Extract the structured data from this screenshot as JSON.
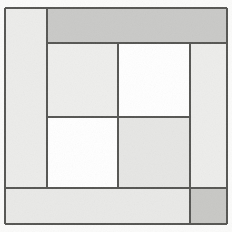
{
  "artwork": {
    "title": "Geometric Block Composition",
    "medium": "abstract rectangular grid",
    "canvas_width": 232,
    "canvas_height": 232,
    "background_color": "#fbfbfa",
    "line_color": "#555552",
    "line_width": 1.5
  },
  "palette": {
    "paper": "#fbfbfa",
    "white": "#ffffff",
    "light_gray": "#ececeb",
    "pale_gray": "#e4e4e2",
    "medium_gray": "#c9c9c7",
    "dark_edge": "#5a5a57"
  },
  "blocks": [
    {
      "name": "top-band",
      "label": "top band",
      "fill": "#c9c9c7",
      "x": 47,
      "y": 8,
      "w": 180,
      "h": 35
    },
    {
      "name": "left-strip",
      "label": "left vertical strip",
      "fill": "#ececea",
      "x": 5,
      "y": 8,
      "w": 42,
      "h": 180
    },
    {
      "name": "inner-upper-left",
      "label": "inner upper left block",
      "fill": "#eeeeec",
      "x": 47,
      "y": 43,
      "w": 71,
      "h": 74
    },
    {
      "name": "upper-right-white",
      "label": "upper right white block",
      "fill": "#ffffff",
      "x": 118,
      "y": 43,
      "w": 72,
      "h": 74
    },
    {
      "name": "right-strip",
      "label": "right vertical strip",
      "fill": "#ededeb",
      "x": 190,
      "y": 43,
      "w": 37,
      "h": 145
    },
    {
      "name": "lower-left-white",
      "label": "lower left white block",
      "fill": "#ffffff",
      "x": 47,
      "y": 117,
      "w": 71,
      "h": 71
    },
    {
      "name": "center-lower-gray",
      "label": "center lower gray block",
      "fill": "#e6e6e4",
      "x": 118,
      "y": 117,
      "w": 72,
      "h": 71
    },
    {
      "name": "bottom-band",
      "label": "bottom band",
      "fill": "#e9e9e7",
      "x": 5,
      "y": 188,
      "w": 185,
      "h": 36
    },
    {
      "name": "bottom-right-corner",
      "label": "bottom right corner square",
      "fill": "#c8c8c5",
      "x": 190,
      "y": 188,
      "w": 37,
      "h": 36
    }
  ],
  "dividers": [
    {
      "name": "outer-top-edge",
      "orientation": "horizontal",
      "x": 5,
      "y": 8,
      "length": 222
    },
    {
      "name": "outer-bottom-edge",
      "orientation": "horizontal",
      "x": 5,
      "y": 224,
      "length": 222
    },
    {
      "name": "outer-left-edge",
      "orientation": "vertical",
      "x": 5,
      "y": 8,
      "length": 216
    },
    {
      "name": "outer-right-edge",
      "orientation": "vertical",
      "x": 227,
      "y": 8,
      "length": 216
    },
    {
      "name": "top-band-bottom",
      "orientation": "horizontal",
      "x": 47,
      "y": 43,
      "length": 180
    },
    {
      "name": "left-strip-right",
      "orientation": "vertical",
      "x": 47,
      "y": 8,
      "length": 180
    },
    {
      "name": "center-horizontal",
      "orientation": "horizontal",
      "x": 47,
      "y": 117,
      "length": 143
    },
    {
      "name": "center-vertical",
      "orientation": "vertical",
      "x": 118,
      "y": 43,
      "length": 145
    },
    {
      "name": "right-strip-left",
      "orientation": "vertical",
      "x": 190,
      "y": 43,
      "length": 181
    },
    {
      "name": "bottom-band-top",
      "orientation": "horizontal",
      "x": 5,
      "y": 188,
      "length": 222
    }
  ]
}
